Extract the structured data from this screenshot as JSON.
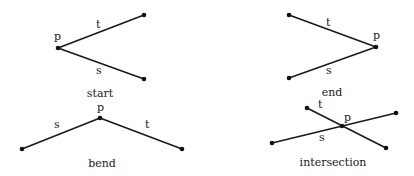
{
  "panels": [
    {
      "caption": "start",
      "labels": {
        "p": "p",
        "t": "t",
        "s": "s"
      }
    },
    {
      "caption": "end",
      "labels": {
        "p": "p",
        "t": "t",
        "s": "s"
      }
    },
    {
      "caption": "bend",
      "labels": {
        "p": "p",
        "t": "t",
        "s": "s"
      }
    },
    {
      "caption": "intersection",
      "labels": {
        "p": "p",
        "t": "t",
        "s": "s"
      }
    }
  ]
}
